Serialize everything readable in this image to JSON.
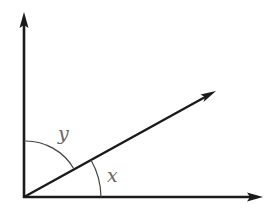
{
  "diagram": {
    "type": "angle-diagram",
    "labels": {
      "angle_between_vertical_and_ray": "y",
      "angle_between_ray_and_horizontal": "x"
    },
    "rays": [
      "vertical-up",
      "diagonal",
      "horizontal-right"
    ],
    "colors": {
      "line": "#1a1a1a",
      "arc": "#444444",
      "label": "#666666",
      "background": "#ffffff"
    }
  }
}
